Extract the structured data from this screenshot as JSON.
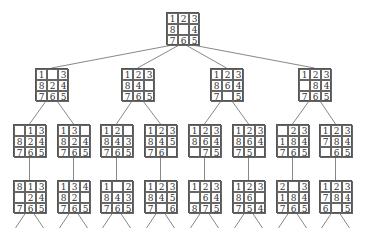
{
  "line_color": "#555555",
  "nodes": [
    {
      "id": "root",
      "x": 166,
      "y": 12,
      "tiles": [
        "1",
        "2",
        "3",
        "8",
        "",
        "4",
        "7",
        "6",
        "5"
      ]
    },
    {
      "id": "l1a",
      "x": 35,
      "y": 68,
      "tiles": [
        "1",
        "",
        "3",
        "8",
        "2",
        "4",
        "7",
        "6",
        "5"
      ]
    },
    {
      "id": "l1b",
      "x": 121,
      "y": 68,
      "tiles": [
        "1",
        "2",
        "3",
        "8",
        "4",
        "",
        "7",
        "6",
        "5"
      ]
    },
    {
      "id": "l1c",
      "x": 210,
      "y": 68,
      "tiles": [
        "1",
        "2",
        "3",
        "8",
        "6",
        "4",
        "7",
        "",
        "5"
      ]
    },
    {
      "id": "l1d",
      "x": 298,
      "y": 68,
      "tiles": [
        "1",
        "2",
        "3",
        "",
        "8",
        "4",
        "7",
        "6",
        "5"
      ]
    },
    {
      "id": "l2a",
      "x": 13,
      "y": 124,
      "tiles": [
        "",
        "1",
        "3",
        "8",
        "2",
        "4",
        "7",
        "6",
        "5"
      ]
    },
    {
      "id": "l2b",
      "x": 57,
      "y": 124,
      "tiles": [
        "1",
        "3",
        "",
        "8",
        "2",
        "4",
        "7",
        "6",
        "5"
      ]
    },
    {
      "id": "l2c",
      "x": 100,
      "y": 124,
      "tiles": [
        "1",
        "2",
        "",
        "8",
        "4",
        "3",
        "7",
        "6",
        "5"
      ]
    },
    {
      "id": "l2d",
      "x": 144,
      "y": 124,
      "tiles": [
        "1",
        "2",
        "3",
        "8",
        "4",
        "5",
        "7",
        "6",
        ""
      ]
    },
    {
      "id": "l2e",
      "x": 188,
      "y": 124,
      "tiles": [
        "1",
        "2",
        "3",
        "8",
        "6",
        "4",
        "",
        "7",
        "5"
      ]
    },
    {
      "id": "l2f",
      "x": 232,
      "y": 124,
      "tiles": [
        "1",
        "2",
        "3",
        "8",
        "6",
        "4",
        "7",
        "5",
        ""
      ]
    },
    {
      "id": "l2g",
      "x": 276,
      "y": 124,
      "tiles": [
        "",
        "2",
        "3",
        "1",
        "8",
        "4",
        "7",
        "6",
        "5"
      ]
    },
    {
      "id": "l2h",
      "x": 319,
      "y": 124,
      "tiles": [
        "1",
        "2",
        "3",
        "7",
        "8",
        "4",
        "",
        "6",
        "5"
      ]
    },
    {
      "id": "l3a",
      "x": 13,
      "y": 180,
      "tiles": [
        "8",
        "1",
        "3",
        "",
        "2",
        "4",
        "7",
        "6",
        "5"
      ]
    },
    {
      "id": "l3b",
      "x": 57,
      "y": 180,
      "tiles": [
        "1",
        "3",
        "4",
        "8",
        "2",
        "",
        "7",
        "6",
        "5"
      ]
    },
    {
      "id": "l3c",
      "x": 100,
      "y": 180,
      "tiles": [
        "1",
        "",
        "2",
        "8",
        "4",
        "3",
        "7",
        "6",
        "5"
      ]
    },
    {
      "id": "l3d",
      "x": 144,
      "y": 180,
      "tiles": [
        "1",
        "2",
        "3",
        "8",
        "4",
        "5",
        "7",
        "",
        "6"
      ]
    },
    {
      "id": "l3e",
      "x": 188,
      "y": 180,
      "tiles": [
        "1",
        "2",
        "3",
        "",
        "6",
        "4",
        "8",
        "7",
        "5"
      ]
    },
    {
      "id": "l3f",
      "x": 232,
      "y": 180,
      "tiles": [
        "1",
        "2",
        "3",
        "8",
        "6",
        "",
        "7",
        "5",
        "4"
      ]
    },
    {
      "id": "l3g",
      "x": 276,
      "y": 180,
      "tiles": [
        "2",
        "",
        "3",
        "1",
        "8",
        "4",
        "7",
        "6",
        "5"
      ]
    },
    {
      "id": "l3h",
      "x": 319,
      "y": 180,
      "tiles": [
        "1",
        "2",
        "3",
        "7",
        "8",
        "4",
        "6",
        "",
        "5"
      ]
    }
  ],
  "edges": [
    [
      "root",
      "l1a"
    ],
    [
      "root",
      "l1b"
    ],
    [
      "root",
      "l1c"
    ],
    [
      "root",
      "l1d"
    ],
    [
      "l1a",
      "l2a"
    ],
    [
      "l1a",
      "l2b"
    ],
    [
      "l1b",
      "l2c"
    ],
    [
      "l1b",
      "l2d"
    ],
    [
      "l1c",
      "l2e"
    ],
    [
      "l1c",
      "l2f"
    ],
    [
      "l1d",
      "l2g"
    ],
    [
      "l1d",
      "l2h"
    ],
    [
      "l2a",
      "l3a"
    ],
    [
      "l2b",
      "l3b"
    ],
    [
      "l2c",
      "l3c"
    ],
    [
      "l2d",
      "l3d"
    ],
    [
      "l2e",
      "l3e"
    ],
    [
      "l2f",
      "l3f"
    ],
    [
      "l2g",
      "l3g"
    ],
    [
      "l2h",
      "l3h"
    ]
  ],
  "leaf_stub_length": 15
}
